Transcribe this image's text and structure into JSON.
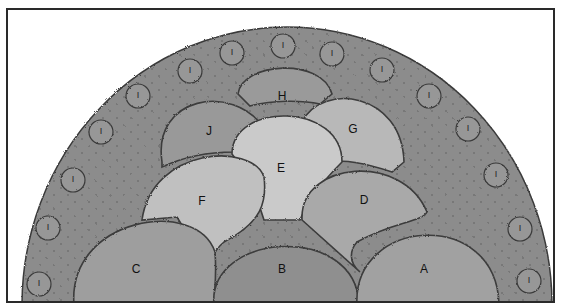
{
  "diagram": {
    "type": "planting-plan",
    "shape": "semicircle",
    "colors": {
      "border_bed": "#8c8c8c",
      "frame": "#2a2a2a",
      "dark_plant": "#8e8e8e",
      "mid_plant": "#a2a2a2",
      "light_plant": "#bdbdbd",
      "lightest_plant": "#cacaca",
      "shrub_I": "#969696"
    },
    "plants": [
      {
        "id": "A",
        "label": "A"
      },
      {
        "id": "B",
        "label": "B"
      },
      {
        "id": "C",
        "label": "C"
      },
      {
        "id": "D",
        "label": "D"
      },
      {
        "id": "E",
        "label": "E"
      },
      {
        "id": "F",
        "label": "F"
      },
      {
        "id": "G",
        "label": "G"
      },
      {
        "id": "H",
        "label": "H"
      },
      {
        "id": "J",
        "label": "J"
      }
    ],
    "edging_plant_label": "I",
    "edging_plant_count": 16
  }
}
